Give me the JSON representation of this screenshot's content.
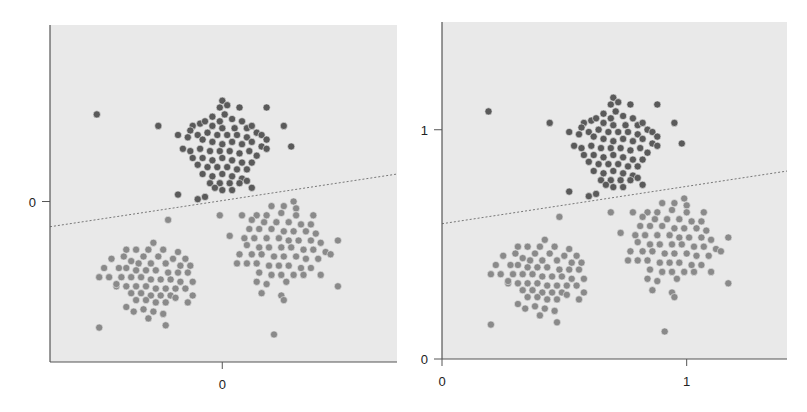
{
  "chart_data": [
    {
      "type": "scatter",
      "title": "",
      "xlabel": "",
      "ylabel": "",
      "description": "Centered data (mean subtracted) with linear decision boundary",
      "xlim": [
        -0.7,
        0.71
      ],
      "ylim": [
        -0.7,
        0.77
      ],
      "xticks": [
        0
      ],
      "xtick_labels": [
        "0"
      ],
      "yticks": [
        0
      ],
      "ytick_labels": [
        "0"
      ],
      "grid": false,
      "offset": [
        -0.7,
        -0.7
      ],
      "boundary": {
        "style": "dashed",
        "intercept": -0.11,
        "slope": 0.163
      }
    },
    {
      "type": "scatter",
      "title": "",
      "xlabel": "",
      "ylabel": "",
      "description": "Original data with linear decision boundary",
      "xlim": [
        0,
        1.41
      ],
      "ylim": [
        0,
        1.47
      ],
      "xticks": [
        0,
        1
      ],
      "xtick_labels": [
        "0",
        "1"
      ],
      "yticks": [
        0,
        1
      ],
      "ytick_labels": [
        "0",
        "1"
      ],
      "grid": false,
      "offset": [
        0,
        0
      ],
      "boundary": {
        "style": "dashed",
        "intercept": 0.59,
        "slope": 0.163
      }
    }
  ],
  "series": [
    {
      "name": "class-a",
      "color": "#5a5a5a",
      "points": [
        [
          0.19,
          1.08
        ],
        [
          0.44,
          1.03
        ],
        [
          0.52,
          0.99
        ],
        [
          0.52,
          0.73
        ],
        [
          0.63,
          0.72
        ],
        [
          0.6,
          0.71
        ],
        [
          0.88,
          1.11
        ],
        [
          0.95,
          1.03
        ],
        [
          0.98,
          0.94
        ],
        [
          0.7,
          1.14
        ],
        [
          0.72,
          1.12
        ],
        [
          0.77,
          1.11
        ],
        [
          0.69,
          1.11
        ],
        [
          0.71,
          1.08
        ],
        [
          0.66,
          1.07
        ],
        [
          0.69,
          1.05
        ],
        [
          0.74,
          1.06
        ],
        [
          0.78,
          1.05
        ],
        [
          0.61,
          1.04
        ],
        [
          0.63,
          1.05
        ],
        [
          0.58,
          1.03
        ],
        [
          0.66,
          1.03
        ],
        [
          0.7,
          1.02
        ],
        [
          0.75,
          1.02
        ],
        [
          0.8,
          1.02
        ],
        [
          0.82,
          1.03
        ],
        [
          0.84,
          1.0
        ],
        [
          0.57,
          1.01
        ],
        [
          0.6,
          0.99
        ],
        [
          0.64,
          1.0
        ],
        [
          0.68,
          0.99
        ],
        [
          0.72,
          0.99
        ],
        [
          0.76,
          0.99
        ],
        [
          0.8,
          0.98
        ],
        [
          0.86,
          0.99
        ],
        [
          0.88,
          0.97
        ],
        [
          0.56,
          0.98
        ],
        [
          0.62,
          0.97
        ],
        [
          0.66,
          0.96
        ],
        [
          0.7,
          0.95
        ],
        [
          0.74,
          0.96
        ],
        [
          0.78,
          0.95
        ],
        [
          0.82,
          0.96
        ],
        [
          0.86,
          0.94
        ],
        [
          0.88,
          0.93
        ],
        [
          0.54,
          0.93
        ],
        [
          0.57,
          0.92
        ],
        [
          0.61,
          0.93
        ],
        [
          0.65,
          0.92
        ],
        [
          0.69,
          0.92
        ],
        [
          0.73,
          0.92
        ],
        [
          0.77,
          0.91
        ],
        [
          0.81,
          0.92
        ],
        [
          0.84,
          0.9
        ],
        [
          0.58,
          0.89
        ],
        [
          0.62,
          0.89
        ],
        [
          0.66,
          0.88
        ],
        [
          0.7,
          0.89
        ],
        [
          0.74,
          0.88
        ],
        [
          0.78,
          0.87
        ],
        [
          0.82,
          0.87
        ],
        [
          0.6,
          0.86
        ],
        [
          0.64,
          0.85
        ],
        [
          0.68,
          0.85
        ],
        [
          0.72,
          0.85
        ],
        [
          0.76,
          0.84
        ],
        [
          0.8,
          0.84
        ],
        [
          0.62,
          0.82
        ],
        [
          0.66,
          0.81
        ],
        [
          0.7,
          0.82
        ],
        [
          0.74,
          0.81
        ],
        [
          0.78,
          0.8
        ],
        [
          0.65,
          0.78
        ],
        [
          0.69,
          0.78
        ],
        [
          0.73,
          0.78
        ],
        [
          0.77,
          0.78
        ],
        [
          0.7,
          0.75
        ],
        [
          0.74,
          0.75
        ],
        [
          0.82,
          0.76
        ],
        [
          0.67,
          0.76
        ],
        [
          0.8,
          0.79
        ]
      ]
    },
    {
      "name": "class-b",
      "color": "#8a8a8a",
      "points": [
        [
          0.48,
          0.62
        ],
        [
          0.2,
          0.15
        ],
        [
          0.47,
          0.16
        ],
        [
          0.31,
          0.49
        ],
        [
          0.27,
          0.33
        ],
        [
          0.55,
          0.45
        ],
        [
          0.42,
          0.52
        ],
        [
          0.35,
          0.49
        ],
        [
          0.46,
          0.49
        ],
        [
          0.4,
          0.49
        ],
        [
          0.52,
          0.48
        ],
        [
          0.3,
          0.46
        ],
        [
          0.38,
          0.46
        ],
        [
          0.44,
          0.46
        ],
        [
          0.5,
          0.45
        ],
        [
          0.25,
          0.45
        ],
        [
          0.33,
          0.44
        ],
        [
          0.36,
          0.43
        ],
        [
          0.41,
          0.43
        ],
        [
          0.47,
          0.43
        ],
        [
          0.53,
          0.42
        ],
        [
          0.57,
          0.42
        ],
        [
          0.22,
          0.41
        ],
        [
          0.28,
          0.41
        ],
        [
          0.31,
          0.41
        ],
        [
          0.35,
          0.4
        ],
        [
          0.39,
          0.4
        ],
        [
          0.43,
          0.4
        ],
        [
          0.48,
          0.39
        ],
        [
          0.52,
          0.39
        ],
        [
          0.56,
          0.39
        ],
        [
          0.2,
          0.37
        ],
        [
          0.24,
          0.37
        ],
        [
          0.29,
          0.37
        ],
        [
          0.33,
          0.37
        ],
        [
          0.37,
          0.37
        ],
        [
          0.41,
          0.36
        ],
        [
          0.45,
          0.36
        ],
        [
          0.49,
          0.36
        ],
        [
          0.53,
          0.35
        ],
        [
          0.58,
          0.35
        ],
        [
          0.27,
          0.34
        ],
        [
          0.31,
          0.33
        ],
        [
          0.35,
          0.33
        ],
        [
          0.39,
          0.33
        ],
        [
          0.43,
          0.32
        ],
        [
          0.47,
          0.32
        ],
        [
          0.51,
          0.32
        ],
        [
          0.55,
          0.32
        ],
        [
          0.33,
          0.3
        ],
        [
          0.37,
          0.3
        ],
        [
          0.41,
          0.29
        ],
        [
          0.45,
          0.29
        ],
        [
          0.49,
          0.29
        ],
        [
          0.35,
          0.27
        ],
        [
          0.39,
          0.27
        ],
        [
          0.43,
          0.26
        ],
        [
          0.47,
          0.26
        ],
        [
          0.51,
          0.28
        ],
        [
          0.38,
          0.23
        ],
        [
          0.42,
          0.22
        ],
        [
          0.46,
          0.21
        ],
        [
          0.34,
          0.22
        ],
        [
          0.31,
          0.24
        ],
        [
          0.4,
          0.19
        ],
        [
          0.58,
          0.29
        ],
        [
          0.56,
          0.26
        ]
      ]
    },
    {
      "name": "class-c",
      "color": "#8a8a8a",
      "points": [
        [
          0.69,
          0.64
        ],
        [
          0.78,
          0.64
        ],
        [
          0.73,
          0.55
        ],
        [
          1.17,
          0.33
        ],
        [
          0.91,
          0.12
        ],
        [
          1.17,
          0.53
        ],
        [
          0.99,
          0.7
        ],
        [
          0.9,
          0.68
        ],
        [
          0.95,
          0.68
        ],
        [
          1.0,
          0.67
        ],
        [
          0.84,
          0.64
        ],
        [
          0.88,
          0.64
        ],
        [
          0.94,
          0.65
        ],
        [
          1.0,
          0.64
        ],
        [
          1.07,
          0.64
        ],
        [
          0.82,
          0.62
        ],
        [
          0.87,
          0.61
        ],
        [
          0.92,
          0.61
        ],
        [
          0.97,
          0.61
        ],
        [
          1.02,
          0.6
        ],
        [
          1.06,
          0.6
        ],
        [
          0.81,
          0.58
        ],
        [
          0.85,
          0.58
        ],
        [
          0.9,
          0.58
        ],
        [
          0.95,
          0.57
        ],
        [
          0.99,
          0.57
        ],
        [
          1.04,
          0.57
        ],
        [
          1.08,
          0.56
        ],
        [
          0.79,
          0.54
        ],
        [
          0.83,
          0.54
        ],
        [
          0.88,
          0.54
        ],
        [
          0.93,
          0.54
        ],
        [
          0.97,
          0.53
        ],
        [
          1.01,
          0.53
        ],
        [
          1.06,
          0.53
        ],
        [
          1.1,
          0.52
        ],
        [
          0.8,
          0.51
        ],
        [
          0.85,
          0.5
        ],
        [
          0.89,
          0.5
        ],
        [
          0.94,
          0.5
        ],
        [
          0.98,
          0.5
        ],
        [
          1.03,
          0.49
        ],
        [
          1.07,
          0.49
        ],
        [
          1.12,
          0.48
        ],
        [
          0.77,
          0.47
        ],
        [
          0.82,
          0.47
        ],
        [
          0.86,
          0.47
        ],
        [
          0.91,
          0.46
        ],
        [
          0.95,
          0.46
        ],
        [
          1.0,
          0.46
        ],
        [
          1.04,
          0.45
        ],
        [
          1.09,
          0.45
        ],
        [
          1.14,
          0.47
        ],
        [
          0.76,
          0.43
        ],
        [
          0.8,
          0.43
        ],
        [
          0.84,
          0.43
        ],
        [
          0.89,
          0.42
        ],
        [
          0.93,
          0.42
        ],
        [
          0.97,
          0.42
        ],
        [
          1.02,
          0.41
        ],
        [
          1.06,
          0.41
        ],
        [
          0.85,
          0.39
        ],
        [
          0.9,
          0.38
        ],
        [
          0.94,
          0.38
        ],
        [
          0.99,
          0.38
        ],
        [
          1.03,
          0.38
        ],
        [
          0.84,
          0.35
        ],
        [
          0.88,
          0.34
        ],
        [
          0.96,
          0.35
        ],
        [
          0.86,
          0.3
        ],
        [
          0.94,
          0.29
        ],
        [
          0.95,
          0.27
        ],
        [
          1.1,
          0.38
        ]
      ]
    }
  ]
}
